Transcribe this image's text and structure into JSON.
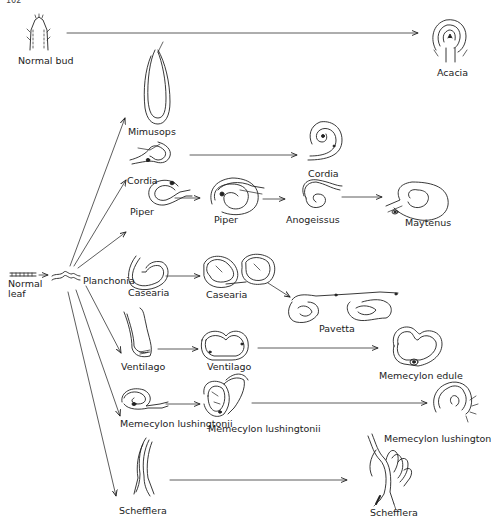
{
  "page_number": "162",
  "nodes": {
    "normal_bud": "Normal bud",
    "acacia": "Acacia",
    "mimusops": "Mimusops",
    "cordia_1": "Cordia",
    "cordia_2": "Cordia",
    "piper_1": "Piper",
    "piper_2": "Piper",
    "anogeissus": "Anogeissus",
    "maytenus": "Maytenus",
    "normal_leaf": "Normal leaf",
    "planchonia": "Planchonia",
    "casearia_1": "Casearia",
    "casearia_2": "Casearia",
    "pavetta": "Pavetta",
    "ventilago_1": "Ventilago",
    "ventilago_2": "Ventilago",
    "memecylon_edule": "Memecylon edule",
    "memecylon_lush_1": "Memecylon lushingtonii",
    "memecylon_lush_2": "Memecylon lushingtonii",
    "memecylon_lush_3": "Memecylon lushington",
    "schefflera_1": "Schefflera",
    "schefflera_2": "Schefflera"
  },
  "edges": [
    [
      "normal_bud",
      "acacia"
    ],
    [
      "normal_leaf",
      "planchonia"
    ],
    [
      "planchonia",
      "mimusops"
    ],
    [
      "planchonia",
      "cordia_1"
    ],
    [
      "planchonia",
      "piper_1"
    ],
    [
      "planchonia",
      "casearia_1"
    ],
    [
      "planchonia",
      "ventilago_1"
    ],
    [
      "planchonia",
      "memecylon_lush_1"
    ],
    [
      "planchonia",
      "schefflera_1"
    ],
    [
      "cordia_1",
      "cordia_2"
    ],
    [
      "piper_1",
      "piper_2"
    ],
    [
      "piper_2",
      "anogeissus"
    ],
    [
      "anogeissus",
      "maytenus"
    ],
    [
      "casearia_1",
      "casearia_2"
    ],
    [
      "casearia_2",
      "pavetta"
    ],
    [
      "ventilago_1",
      "ventilago_2"
    ],
    [
      "ventilago_2",
      "memecylon_edule"
    ],
    [
      "memecylon_lush_1",
      "memecylon_lush_2"
    ],
    [
      "memecylon_lush_2",
      "memecylon_lush_3"
    ],
    [
      "schefflera_1",
      "schefflera_2"
    ]
  ]
}
